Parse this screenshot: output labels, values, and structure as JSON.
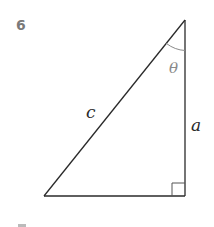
{
  "problem": {
    "number": "6"
  },
  "diagram": {
    "type": "right-triangle",
    "labels": {
      "hypotenuse": "c",
      "vertical_leg": "a",
      "angle": "θ"
    },
    "colors": {
      "stroke": "#2a2a2a",
      "angle_arc": "#8a8a8a",
      "angle_label": "#8a8a8a",
      "number": "#7a7a7a"
    }
  }
}
